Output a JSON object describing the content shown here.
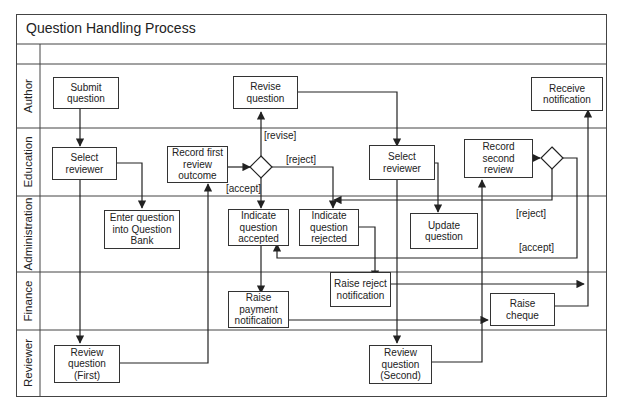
{
  "diagram": {
    "title": "Question Handling Process",
    "lanes": [
      {
        "id": "author",
        "label": "Author"
      },
      {
        "id": "education",
        "label": "Education"
      },
      {
        "id": "administration",
        "label": "Administration"
      },
      {
        "id": "finance",
        "label": "Finance"
      },
      {
        "id": "reviewer",
        "label": "Reviewer"
      }
    ],
    "nodes": {
      "submit_question": "Submit\nquestion",
      "revise_question": "Revise\nquestion",
      "receive_notification": "Receive\nnotification",
      "select_reviewer_1": "Select\nreviewer",
      "record_first_review": "Record first\nreview\noutcome",
      "select_reviewer_2": "Select\nreviewer",
      "record_second_review": "Record\nsecond\nreview",
      "enter_question_bank": "Enter question\ninto Question\nBank",
      "indicate_accepted": "Indicate\nquestion\naccepted",
      "indicate_rejected": "Indicate\nquestion\nrejected",
      "update_question": "Update\nquestion",
      "raise_payment_notification": "Raise\npayment\nnotification",
      "raise_reject_notification": "Raise reject\nnotification",
      "raise_cheque": "Raise\ncheque",
      "review_question_first": "Review\nquestion\n(First)",
      "review_question_second": "Review\nquestion\n(Second)"
    },
    "decisions": [
      "first-review-decision",
      "second-review-decision"
    ],
    "guards": {
      "revise": "[revise]",
      "reject_1": "[reject]",
      "accept_1": "[accept]",
      "reject_2": "[reject]",
      "accept_2": "[accept]"
    },
    "colors": {
      "line": "#333333",
      "frame": "#444444",
      "background": "#ffffff"
    }
  }
}
